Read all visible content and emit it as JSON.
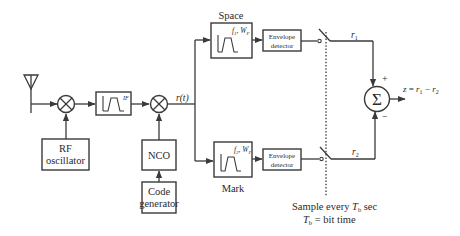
{
  "diagram": {
    "blocks": {
      "antenna": {
        "label": ""
      },
      "rf_oscillator": {
        "line1": "RF",
        "line2": "oscillator"
      },
      "if_filter": {
        "label": "IF"
      },
      "nco": {
        "label": "NCO"
      },
      "code_generator": {
        "line1": "Code",
        "line2": "generator"
      },
      "space_filter": {
        "title": "Space",
        "f": "f",
        "f_sub": "1",
        "w": "W",
        "w_sub": "F"
      },
      "mark_filter": {
        "title": "Mark",
        "f": "f",
        "f_sub": "2",
        "w": "W",
        "w_sub": "F"
      },
      "envelope_detector_upper": {
        "line1": "Envelope",
        "line2": "detector"
      },
      "envelope_detector_lower": {
        "line1": "Envelope",
        "line2": "detector"
      },
      "summer": {
        "symbol": "Σ",
        "plus": "+",
        "minus": "−"
      }
    },
    "signals": {
      "rt": "r(t)",
      "r1": "r",
      "r1_sub": "1",
      "r2": "r",
      "r2_sub": "2",
      "output": {
        "z": "z",
        "eq": " = ",
        "r1": "r",
        "r1_sub": "1",
        "minus": " − ",
        "r2": "r",
        "r2_sub": "2"
      }
    },
    "notes": {
      "sample_prefix": "Sample every ",
      "tb": "T",
      "tb_sub": "b",
      "sample_suffix": " sec",
      "bit_time": " = bit time"
    }
  }
}
